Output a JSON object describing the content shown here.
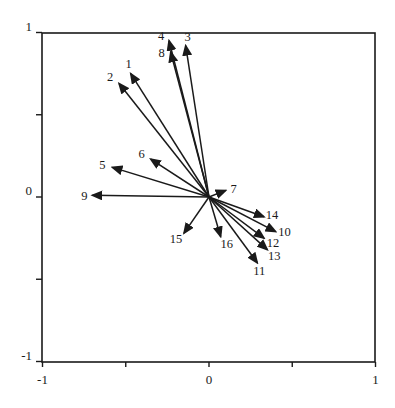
{
  "chart_data": {
    "type": "scatter",
    "subtype": "vector-biplot",
    "title": "",
    "xlabel": "",
    "ylabel": "",
    "xlim": [
      -1,
      1
    ],
    "ylim": [
      -1,
      1
    ],
    "grid": false,
    "legend": null,
    "x_ticks": [
      {
        "value": -1,
        "label": "-1"
      },
      {
        "value": -0.5,
        "label": ""
      },
      {
        "value": 0,
        "label": "0"
      },
      {
        "value": 0.5,
        "label": ""
      },
      {
        "value": 1,
        "label": "1"
      }
    ],
    "y_ticks": [
      {
        "value": -1,
        "label": "-1"
      },
      {
        "value": -0.5,
        "label": ""
      },
      {
        "value": 0,
        "label": "0"
      },
      {
        "value": 0.5,
        "label": ""
      },
      {
        "value": 1,
        "label": "1"
      }
    ],
    "vectors": [
      {
        "label": "1",
        "x": -0.47,
        "y": 0.75
      },
      {
        "label": "2",
        "x": -0.54,
        "y": 0.69
      },
      {
        "label": "3",
        "x": -0.14,
        "y": 0.92
      },
      {
        "label": "4",
        "x": -0.24,
        "y": 0.95
      },
      {
        "label": "5",
        "x": -0.58,
        "y": 0.18
      },
      {
        "label": "6",
        "x": -0.35,
        "y": 0.23
      },
      {
        "label": "7",
        "x": 0.1,
        "y": 0.04
      },
      {
        "label": "8",
        "x": -0.23,
        "y": 0.88
      },
      {
        "label": "9",
        "x": -0.7,
        "y": 0.01
      },
      {
        "label": "10",
        "x": 0.4,
        "y": -0.21
      },
      {
        "label": "11",
        "x": 0.29,
        "y": -0.4
      },
      {
        "label": "12",
        "x": 0.33,
        "y": -0.25
      },
      {
        "label": "13",
        "x": 0.35,
        "y": -0.32
      },
      {
        "label": "14",
        "x": 0.33,
        "y": -0.12
      },
      {
        "label": "15",
        "x": -0.15,
        "y": -0.22
      },
      {
        "label": "16",
        "x": 0.07,
        "y": -0.24
      }
    ],
    "label_offsets": {
      "1": [
        -2,
        -6
      ],
      "2": [
        -9,
        -2
      ],
      "3": [
        2,
        -5
      ],
      "4": [
        -8,
        -1
      ],
      "5": [
        -10,
        2
      ],
      "6": [
        -9,
        -1
      ],
      "7": [
        8,
        3
      ],
      "8": [
        -9,
        5
      ],
      "9": [
        -8,
        5
      ],
      "10": [
        9,
        4
      ],
      "11": [
        2,
        12
      ],
      "12": [
        9,
        9
      ],
      "13": [
        7,
        10
      ],
      "14": [
        8,
        2
      ],
      "15": [
        -8,
        10
      ],
      "16": [
        6,
        12
      ]
    },
    "colors": {
      "ink": "#1a1a1a",
      "background": "#ffffff"
    }
  }
}
